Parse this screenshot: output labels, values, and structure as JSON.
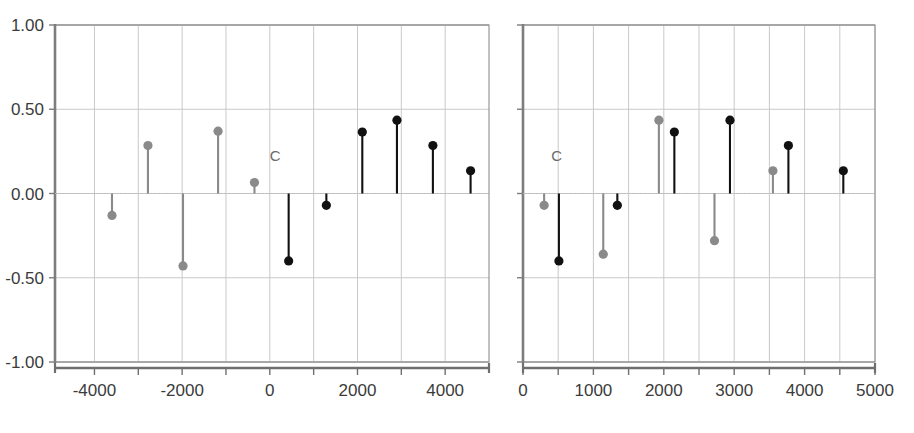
{
  "chart_data": [
    {
      "panel": "left",
      "type": "scatter",
      "title": "",
      "xlabel": "",
      "ylabel": "",
      "xlim": [
        -4900,
        5000
      ],
      "ylim": [
        -1.0,
        1.0
      ],
      "grid": true,
      "legend": "none",
      "yticks": [
        1.0,
        0.5,
        0.0,
        -0.5,
        -1.0
      ],
      "ytick_labels": [
        "1.00",
        "0.50",
        "0.00",
        "-0.50",
        "-1.00"
      ],
      "xticks": [
        -4000,
        -3000,
        -2000,
        -1000,
        0,
        1000,
        2000,
        3000,
        4000
      ],
      "xtick_labels": [
        "-4000",
        "",
        "-2000",
        "",
        "0",
        "",
        "2000",
        "",
        "4000"
      ],
      "annotations": [
        {
          "text": "C",
          "x": 120,
          "y": 0.195
        }
      ],
      "series": [
        {
          "name": "gray",
          "color": "#8a8a8a",
          "points": [
            {
              "x": -3600,
              "y": -0.13
            },
            {
              "x": -2780,
              "y": 0.285
            },
            {
              "x": -1980,
              "y": -0.43
            },
            {
              "x": -1180,
              "y": 0.37
            },
            {
              "x": -350,
              "y": 0.065
            }
          ]
        },
        {
          "name": "black",
          "color": "#111111",
          "points": [
            {
              "x": 430,
              "y": -0.4
            },
            {
              "x": 1290,
              "y": -0.07
            },
            {
              "x": 2110,
              "y": 0.365
            },
            {
              "x": 2900,
              "y": 0.435
            },
            {
              "x": 3720,
              "y": 0.285
            },
            {
              "x": 4580,
              "y": 0.135
            }
          ]
        }
      ]
    },
    {
      "panel": "right",
      "type": "scatter",
      "title": "",
      "xlabel": "",
      "ylabel": "",
      "xlim": [
        0,
        5000
      ],
      "ylim": [
        -1.0,
        1.0
      ],
      "grid": true,
      "legend": "none",
      "yticks": [
        1.0,
        0.5,
        0.0,
        -0.5,
        -1.0
      ],
      "ytick_labels": [
        "",
        "",
        "",
        "",
        ""
      ],
      "xticks": [
        0,
        500,
        1000,
        1500,
        2000,
        2500,
        3000,
        3500,
        4000,
        4500,
        5000
      ],
      "xtick_labels": [
        "0",
        "",
        "1000",
        "",
        "2000",
        "",
        "3000",
        "",
        "4000",
        "",
        "5000"
      ],
      "annotations": [
        {
          "text": "C",
          "x": 480,
          "y": 0.195
        }
      ],
      "series": [
        {
          "name": "gray",
          "color": "#8a8a8a",
          "points": [
            {
              "x": 300,
              "y": -0.07
            },
            {
              "x": 1140,
              "y": -0.36
            },
            {
              "x": 1930,
              "y": 0.435
            },
            {
              "x": 2720,
              "y": -0.28
            },
            {
              "x": 3550,
              "y": 0.135
            }
          ]
        },
        {
          "name": "black",
          "color": "#111111",
          "points": [
            {
              "x": 510,
              "y": -0.4
            },
            {
              "x": 1340,
              "y": -0.07
            },
            {
              "x": 2150,
              "y": 0.365
            },
            {
              "x": 2940,
              "y": 0.435
            },
            {
              "x": 3770,
              "y": 0.285
            },
            {
              "x": 4550,
              "y": 0.135
            }
          ]
        }
      ]
    }
  ],
  "axes": {
    "left": {
      "ytick_labels": [
        "1.00",
        "0.50",
        "0.00",
        "-0.50",
        "-1.00"
      ],
      "xtick_labels": [
        "-4000",
        "-2000",
        "0",
        "2000",
        "4000"
      ]
    },
    "right": {
      "xtick_labels": [
        "0",
        "1000",
        "2000",
        "3000",
        "4000",
        "5000"
      ]
    }
  },
  "style": {
    "gray_color": "#8a8a8a",
    "black_color": "#111111",
    "grid_color": "#c9c9c9",
    "axis_color": "#8e8e8e",
    "zero_line_color": "#b5b5b5",
    "text_color": "#3b3b3b"
  }
}
